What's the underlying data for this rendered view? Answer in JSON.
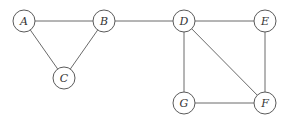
{
  "graph": {
    "nodes": [
      {
        "id": "A",
        "label": "A",
        "x": 24,
        "y": 21
      },
      {
        "id": "B",
        "label": "B",
        "x": 104,
        "y": 21
      },
      {
        "id": "C",
        "label": "C",
        "x": 64,
        "y": 78
      },
      {
        "id": "D",
        "label": "D",
        "x": 184,
        "y": 21
      },
      {
        "id": "E",
        "label": "E",
        "x": 265,
        "y": 21
      },
      {
        "id": "F",
        "label": "F",
        "x": 265,
        "y": 103
      },
      {
        "id": "G",
        "label": "G",
        "x": 184,
        "y": 103
      }
    ],
    "edges": [
      [
        "A",
        "B"
      ],
      [
        "A",
        "C"
      ],
      [
        "B",
        "C"
      ],
      [
        "B",
        "D"
      ],
      [
        "D",
        "E"
      ],
      [
        "D",
        "G"
      ],
      [
        "D",
        "F"
      ],
      [
        "E",
        "F"
      ],
      [
        "G",
        "F"
      ]
    ],
    "node_radius": 11
  }
}
